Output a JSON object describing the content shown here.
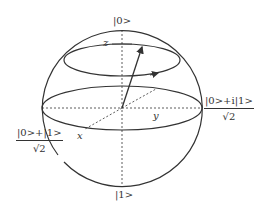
{
  "diagram": {
    "labels": {
      "top_state": "|0>",
      "bottom_state": "|1>",
      "z_axis": "z",
      "x_axis": "x",
      "y_axis": "y",
      "plus_i_numerator": "|0>+i|1>",
      "plus_i_denominator": "√2",
      "plus_numerator": "|0>+|1>",
      "plus_denominator": "√2"
    },
    "colors": {
      "stroke": "#333333",
      "background": "#ffffff"
    }
  }
}
